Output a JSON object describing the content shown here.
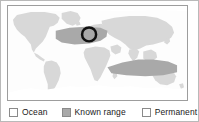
{
  "figure": {
    "name": "world-distribution-map",
    "frame_color": "#b9b9b9"
  },
  "map": {
    "name": "world-map",
    "projection": "equirectangular",
    "colors": {
      "ocean": "#ffffff",
      "land": "#d8d8d8",
      "known_range": "#a9a9a9",
      "permanent_ice": "#ffffff",
      "annotation_circle": "#111111",
      "border": "#9d9d9d"
    },
    "annotation": {
      "name": "highlight-circle",
      "shape": "circle",
      "cx_pct": 45.3,
      "cy_pct": 30.2,
      "r_pct": 7.4,
      "stroke_width": 2.6,
      "color": "#111111"
    }
  },
  "legend": {
    "name": "map-legend",
    "items": [
      {
        "key": "ocean",
        "label": "Ocean",
        "swatch_color": "#ffffff"
      },
      {
        "key": "known_range",
        "label": "Known range",
        "swatch_color": "#a9a9a9"
      },
      {
        "key": "permanent_ice",
        "label": "Permanent ice",
        "swatch_color": "#ffffff"
      }
    ]
  }
}
